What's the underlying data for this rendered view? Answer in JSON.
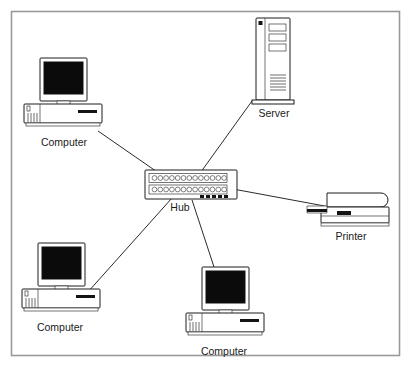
{
  "figure": {
    "background_color": "#ffffff",
    "border_color": "#9a9a9a",
    "line_color": "#2b2b2b",
    "label_color": "#1a1a1a"
  },
  "nodes": [
    {
      "id": "computer-top-left",
      "label": "Computer",
      "type": "computer",
      "x": 62,
      "y": 97,
      "label_x": 64,
      "label_y": 146
    },
    {
      "id": "server",
      "label": "Server",
      "type": "server",
      "x": 271,
      "y": 60,
      "label_x": 274,
      "label_y": 114
    },
    {
      "id": "hub",
      "label": "Hub",
      "type": "hub",
      "x": 191,
      "y": 185,
      "label_x": 180,
      "label_y": 211
    },
    {
      "id": "printer",
      "label": "Printer",
      "type": "printer",
      "x": 352,
      "y": 205,
      "label_x": 351,
      "label_y": 236
    },
    {
      "id": "computer-bottom-left",
      "label": "Computer",
      "type": "computer",
      "x": 60,
      "y": 282,
      "label_x": 57,
      "label_y": 325
    },
    {
      "id": "computer-bottom-center",
      "label": "Computer",
      "type": "computer",
      "x": 223,
      "y": 305,
      "label_x": 224,
      "label_y": 349
    }
  ],
  "links": [
    {
      "id": "link-hub-computer-top-left",
      "from": "hub",
      "to": "computer-top-left"
    },
    {
      "id": "link-hub-server",
      "from": "hub",
      "to": "server"
    },
    {
      "id": "link-hub-printer",
      "from": "hub",
      "to": "printer"
    },
    {
      "id": "link-hub-computer-bottom-left",
      "from": "hub",
      "to": "computer-bottom-left"
    },
    {
      "id": "link-hub-computer-bottom-center",
      "from": "hub",
      "to": "computer-bottom-center"
    }
  ],
  "hub_detail": {
    "ports_per_row": 13,
    "rows": 2,
    "led_count": 5
  },
  "server_detail": {
    "bays": 3,
    "vent_lines": 7,
    "power_led": true
  },
  "computer_detail": {
    "vent_slits": 5,
    "drive_slot": true
  }
}
